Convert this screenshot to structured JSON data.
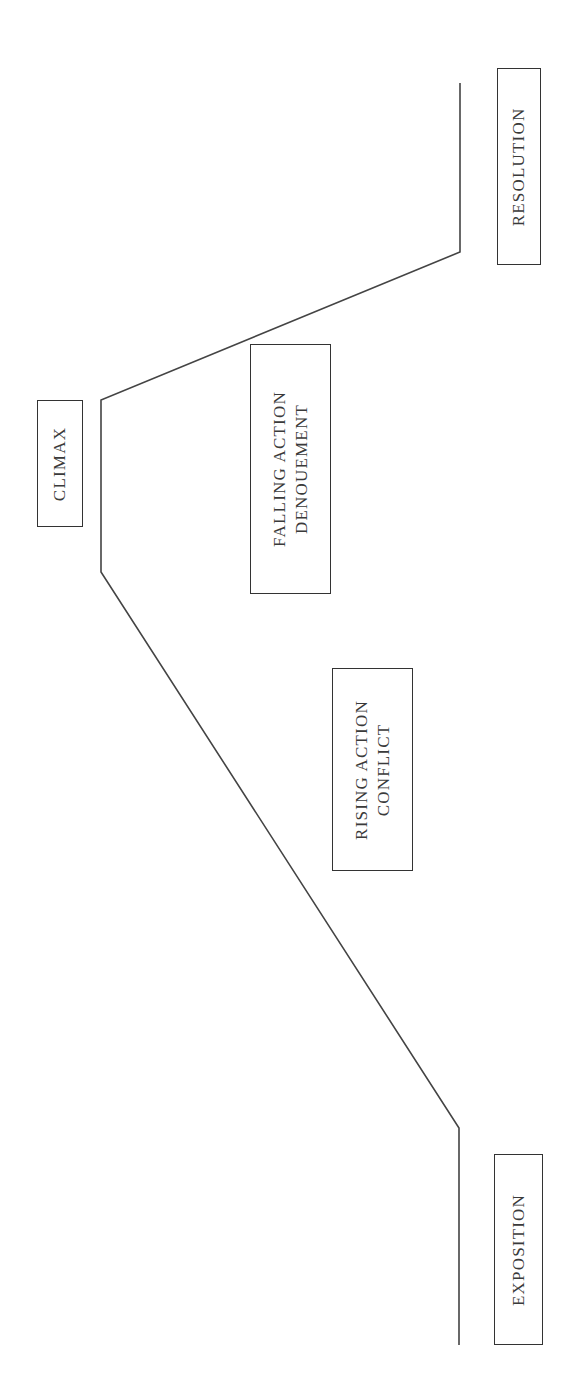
{
  "diagram": {
    "type": "plot-structure (Freytag's pyramid), rotated 90°",
    "line_color": "#444444",
    "stages": [
      {
        "id": "exposition",
        "lines": [
          "EXPOSITION"
        ]
      },
      {
        "id": "rising-action",
        "lines": [
          "RISING ACTION",
          "CONFLICT"
        ]
      },
      {
        "id": "climax",
        "lines": [
          "CLIMAX"
        ]
      },
      {
        "id": "falling-action",
        "lines": [
          "FALLING ACTION",
          "DENOUEMENT"
        ]
      },
      {
        "id": "resolution",
        "lines": [
          "RESOLUTION"
        ]
      }
    ]
  }
}
